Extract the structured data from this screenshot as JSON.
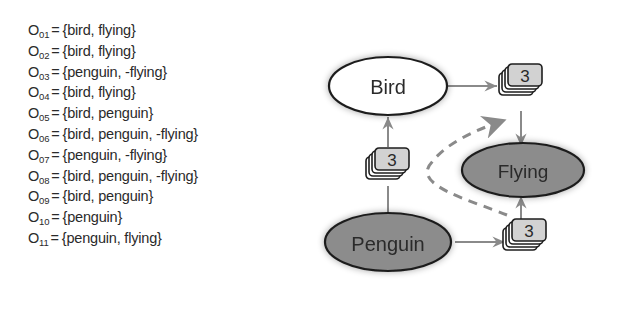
{
  "objects": [
    {
      "name": "O",
      "index": "01",
      "equals": "=",
      "set": "{bird, flying}"
    },
    {
      "name": "O",
      "index": "02",
      "equals": "=",
      "set": "{bird, flying}"
    },
    {
      "name": "O",
      "index": "03",
      "equals": "=",
      "set": "{penguin, -flying}"
    },
    {
      "name": "O",
      "index": "04",
      "equals": "=",
      "set": "{bird, flying}"
    },
    {
      "name": "O",
      "index": "05",
      "equals": "=",
      "set": "{bird, penguin}"
    },
    {
      "name": "O",
      "index": "06",
      "equals": "=",
      "set": "{bird, penguin, -flying}"
    },
    {
      "name": "O",
      "index": "07",
      "equals": "=",
      "set": "{penguin, -flying}"
    },
    {
      "name": "O",
      "index": "08",
      "equals": "=",
      "set": "{bird, penguin, -flying}"
    },
    {
      "name": "O",
      "index": "09",
      "equals": "=",
      "set": "{bird, penguin}"
    },
    {
      "name": "O",
      "index": "10",
      "equals": "=",
      "set": "{penguin}"
    },
    {
      "name": "O",
      "index": "11",
      "equals": "=",
      "set": "{penguin, flying}"
    }
  ],
  "diagram": {
    "nodes": {
      "bird": {
        "label": "Bird",
        "fill": "#ffffff"
      },
      "flying": {
        "label": "Flying",
        "fill": "#8c8c8c"
      },
      "penguin": {
        "label": "Penguin",
        "fill": "#8c8c8c"
      }
    },
    "stacks": {
      "penguin_to_bird": {
        "count": "3"
      },
      "bird_to_flying": {
        "count": "3"
      },
      "penguin_to_flying": {
        "count": "3"
      }
    },
    "colors": {
      "stroke": "#1e1e1e",
      "arrow": "#8a8a8a",
      "dashed": "#8a8a8a",
      "card_fill": "#d2d2d2",
      "text": "#2a2a2a"
    }
  }
}
